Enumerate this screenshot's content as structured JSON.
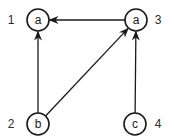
{
  "diagram": {
    "type": "directed-graph",
    "nodes": [
      {
        "id": "1",
        "label": "a",
        "x": 38,
        "y": 20,
        "id_label_x": 11,
        "id_label_y": 20
      },
      {
        "id": "3",
        "label": "a",
        "x": 136,
        "y": 20,
        "id_label_x": 158,
        "id_label_y": 20
      },
      {
        "id": "2",
        "label": "b",
        "x": 38,
        "y": 124,
        "id_label_x": 11,
        "id_label_y": 124
      },
      {
        "id": "4",
        "label": "c",
        "x": 135,
        "y": 124,
        "id_label_x": 158,
        "id_label_y": 124
      }
    ],
    "edges": [
      {
        "from": "3",
        "to": "1"
      },
      {
        "from": "2",
        "to": "1"
      },
      {
        "from": "2",
        "to": "3"
      },
      {
        "from": "4",
        "to": "3"
      }
    ],
    "node_radius": 11,
    "colors": {
      "stroke": "#1a1a1a",
      "background": "#ffffff"
    }
  }
}
